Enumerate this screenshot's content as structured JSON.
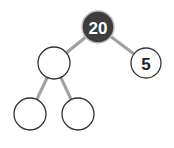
{
  "diagram": {
    "type": "binary-tree",
    "nodes": [
      {
        "id": "root",
        "label": "20",
        "highlighted": true
      },
      {
        "id": "left",
        "label": ""
      },
      {
        "id": "right",
        "label": "5"
      },
      {
        "id": "left-left",
        "label": ""
      },
      {
        "id": "left-right",
        "label": ""
      }
    ],
    "edges": [
      [
        "root",
        "left"
      ],
      [
        "root",
        "right"
      ],
      [
        "left",
        "left-left"
      ],
      [
        "left",
        "left-right"
      ]
    ],
    "colors": {
      "highlight_fill": "#3d3d3d",
      "edge": "#a0a0a0",
      "node_stroke": "#333333"
    }
  }
}
